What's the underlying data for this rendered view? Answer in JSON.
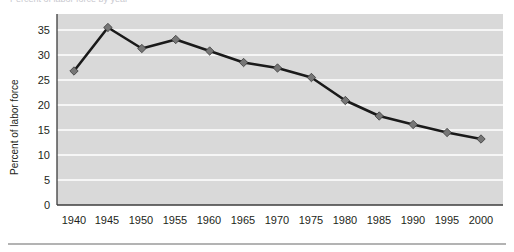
{
  "figure": {
    "caption_sliver": "Percent of labor force by year",
    "bottom_rule": "horizontal-rule"
  },
  "chart_data": {
    "type": "line",
    "title": "",
    "xlabel": "",
    "ylabel": "Percent of labor force",
    "categories": [
      "1940",
      "1945",
      "1950",
      "1955",
      "1960",
      "1965",
      "1970",
      "1975",
      "1980",
      "1985",
      "1990",
      "1995",
      "2000"
    ],
    "values": [
      26.8,
      35.5,
      31.3,
      33.1,
      30.8,
      28.5,
      27.4,
      25.5,
      20.9,
      17.8,
      16.1,
      14.5,
      13.2
    ],
    "x": [
      1940,
      1945,
      1950,
      1955,
      1960,
      1965,
      1970,
      1975,
      1980,
      1985,
      1990,
      1995,
      2000
    ],
    "ylim": [
      0,
      37
    ],
    "yticks": [
      0,
      5,
      10,
      15,
      20,
      25,
      30,
      35
    ],
    "ytick_labels": [
      "0",
      "5",
      "10",
      "15",
      "20",
      "25",
      "30",
      "35"
    ],
    "xlim": [
      1937.5,
      2002.5
    ],
    "grid": "horizontal-white-gridlines",
    "legend": "none",
    "series": [
      {
        "name": "Percent of labor force",
        "values": [
          26.8,
          35.5,
          31.3,
          33.1,
          30.8,
          28.5,
          27.4,
          25.5,
          20.9,
          17.8,
          16.1,
          14.5,
          13.2
        ],
        "line_color": "#1a1a1a",
        "marker": "diamond",
        "marker_color": "#6e6e6e"
      }
    ],
    "colors": {
      "plot_background": "#d9d9d9",
      "gridline": "#ffffff",
      "axis_line": "#3c3c3c",
      "line": "#1a1a1a",
      "marker_fill": "#767676",
      "text": "#231f20"
    }
  }
}
